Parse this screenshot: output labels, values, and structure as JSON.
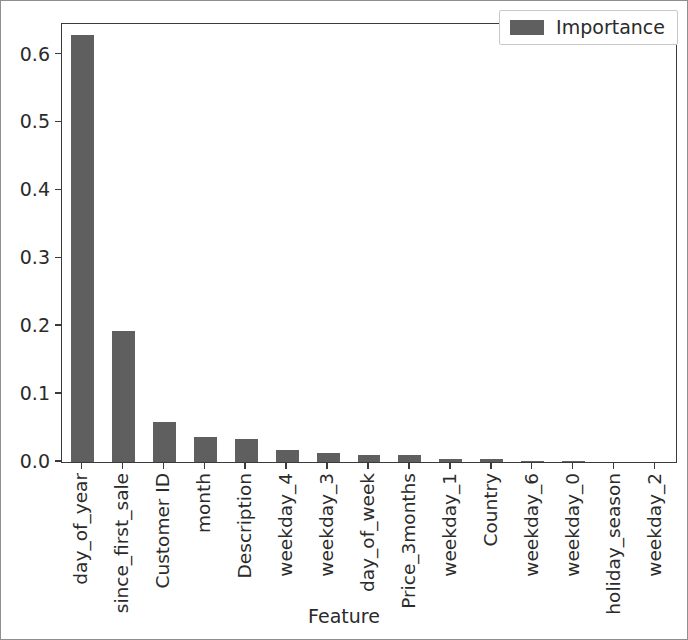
{
  "chart_data": {
    "type": "bar",
    "title": "",
    "xlabel": "Feature",
    "ylabel": "",
    "categories": [
      "day_of_year",
      "since_first_sale",
      "Customer ID",
      "month",
      "Description",
      "weekday_4",
      "weekday_3",
      "day_of_week",
      "Price_3months",
      "weekday_1",
      "Country",
      "weekday_6",
      "weekday_0",
      "holiday_season",
      "weekday_2"
    ],
    "series": [
      {
        "name": "Importance",
        "color": "#5f5f5f",
        "values": [
          0.629,
          0.193,
          0.059,
          0.037,
          0.034,
          0.018,
          0.014,
          0.01,
          0.01,
          0.004,
          0.004,
          0.002,
          0.001,
          0.0,
          0.0
        ]
      }
    ],
    "ylim": [
      0.0,
      0.645
    ],
    "xlim": [
      -0.5,
      14.5
    ],
    "yticks": [
      0.0,
      0.1,
      0.2,
      0.3,
      0.4,
      0.5,
      0.6
    ],
    "ytick_labels": [
      "0.0",
      "0.1",
      "0.2",
      "0.3",
      "0.4",
      "0.5",
      "0.6"
    ],
    "grid": false,
    "legend": {
      "position": "upper right",
      "entries": [
        {
          "label": "Importance",
          "color": "#5f5f5f",
          "marker": "square-swatch"
        }
      ]
    },
    "bar_width_fraction": 0.56,
    "tick_label_rotation": -90
  }
}
